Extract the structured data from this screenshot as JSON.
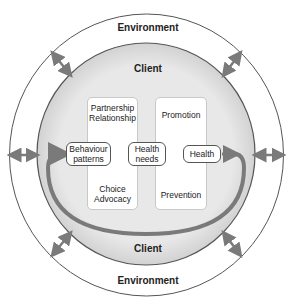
{
  "rings": {
    "environment": {
      "label_top": "Environment",
      "label_bottom": "Environment"
    },
    "client": {
      "label_top": "Client",
      "label_bottom": "Client"
    }
  },
  "columns": {
    "left": {
      "top_text_1": "Partnership",
      "top_text_2": "Relationship",
      "bottom_text_1": "Choice",
      "bottom_text_2": "Advocacy"
    },
    "right": {
      "top_text": "Promotion",
      "bottom_text": "Prevention"
    }
  },
  "nodes": {
    "behaviour": {
      "line1": "Behaviour",
      "line2": "patterns"
    },
    "needs": {
      "line1": "Health",
      "line2": "needs"
    },
    "health": {
      "line1": "Health"
    }
  },
  "colors": {
    "arrow": "#7a7a7a",
    "client_fill": "#e6e6e6",
    "ring_stroke": "#555555"
  }
}
